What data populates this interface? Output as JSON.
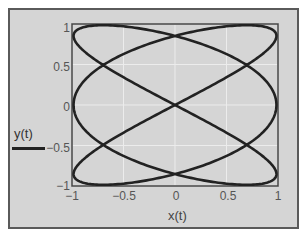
{
  "chart_data": {
    "type": "line",
    "title": "",
    "xlabel": "x(t)",
    "ylabel": "",
    "legend": [
      {
        "label": "y(t)",
        "color": "#222222"
      }
    ],
    "legend_position": "left",
    "xlim": [
      -1,
      1
    ],
    "ylim": [
      -1,
      1
    ],
    "grid": true,
    "x_ticks": [
      "−1",
      "−0.5",
      "0",
      "0.5",
      "1"
    ],
    "x_tick_values": [
      -1,
      -0.5,
      0,
      0.5,
      1
    ],
    "y_ticks": [
      "1",
      "0.5",
      "0",
      "−0.5",
      "−1"
    ],
    "y_tick_values": [
      1,
      0.5,
      0,
      -0.5,
      -1
    ],
    "parametric": {
      "x": "cos(3t)",
      "y": "sin(2t)",
      "t_range": [
        0,
        6.2832
      ],
      "description": "Lissajous curve, frequency ratio 3:2"
    },
    "series": [
      {
        "name": "y(t)",
        "x": [
          1.0,
          0.866,
          0.5,
          0.0,
          -0.5,
          -0.866,
          -1.0,
          -0.866,
          -0.5,
          0.0,
          0.5,
          0.866,
          1.0,
          0.866,
          0.5,
          0.0,
          -0.5,
          -0.866,
          -1.0,
          -0.866,
          -0.5,
          0.0,
          0.5,
          0.866,
          1.0
        ],
        "y": [
          0.0,
          0.342,
          0.643,
          0.866,
          0.985,
          0.985,
          0.866,
          0.643,
          0.342,
          0.0,
          -0.342,
          -0.643,
          -0.866,
          -0.985,
          -0.985,
          -0.866,
          -0.643,
          -0.342,
          0.0,
          0.342,
          0.643,
          0.866,
          0.985,
          0.985,
          0.866
        ]
      }
    ],
    "colors": {
      "frame_bg": "#d5d5d5",
      "frame_border": "#5a5a5a",
      "curve": "#222222",
      "grid": "#ececec",
      "axes_box": "#444444"
    }
  }
}
